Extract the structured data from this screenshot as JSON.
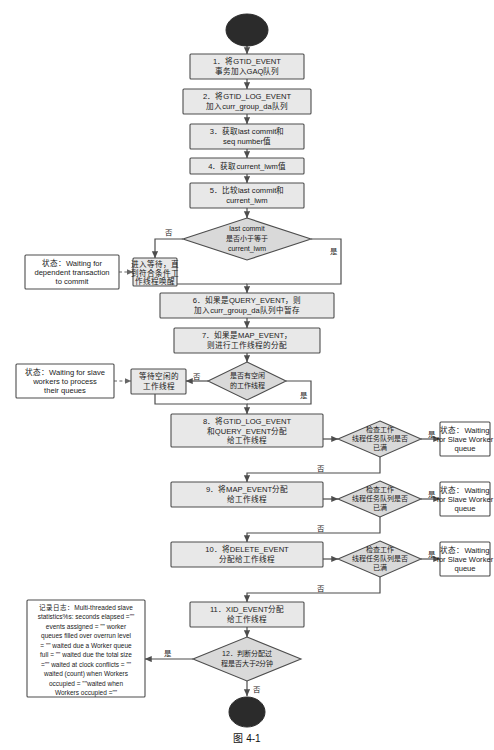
{
  "figure": {
    "caption": "图 4-1",
    "start_node": "",
    "end_node": ""
  },
  "steps": [
    {
      "id": "step1",
      "lines": [
        "1．将GTID_EVENT",
        "事务加入GAQ队列"
      ]
    },
    {
      "id": "step2",
      "lines": [
        "2．将GTID_LOG_EVENT",
        "加入curr_group_da队列"
      ]
    },
    {
      "id": "step3",
      "lines": [
        "3．获取last commit和",
        "seq number值"
      ]
    },
    {
      "id": "step4",
      "lines": [
        "4．获取current_lwm值"
      ]
    },
    {
      "id": "step5",
      "lines": [
        "5．比较last commit和",
        "current_lwm"
      ]
    },
    {
      "id": "wait_dep",
      "lines": [
        "进入等待，直",
        "到符合条件工",
        "作线程唤醒"
      ]
    },
    {
      "id": "step6",
      "lines": [
        "6．如果是QUERY_EVENT，则",
        "加入curr_group_da队列中暂存"
      ]
    },
    {
      "id": "step7",
      "lines": [
        "7．如果是MAP_EVENT，",
        "则进行工作线程的分配"
      ]
    },
    {
      "id": "wait_idle",
      "lines": [
        "等待空闲的",
        "工作线程"
      ]
    },
    {
      "id": "step8",
      "lines": [
        "8．将GTID_LOG_EVENT",
        "和QUERY_EVENT分配",
        "给工作线程"
      ]
    },
    {
      "id": "step9",
      "lines": [
        "9．将MAP_EVENT分配",
        "给工作线程"
      ]
    },
    {
      "id": "step10",
      "lines": [
        "10．将DELETE_EVENT",
        "分配给工作线程"
      ]
    },
    {
      "id": "step11",
      "lines": [
        "11．XID_EVENT分配",
        "给工作线程"
      ]
    }
  ],
  "decisions": [
    {
      "id": "dec_lastcommit",
      "lines": [
        "last commit",
        "是否小于等于",
        "current_lwm"
      ]
    },
    {
      "id": "dec_idle_worker",
      "lines": [
        "是否有空闲",
        "的工作线程"
      ]
    },
    {
      "id": "dec_queue_full_1",
      "lines": [
        "检查工作",
        "线程任务队列是否",
        "已满"
      ]
    },
    {
      "id": "dec_queue_full_2",
      "lines": [
        "检查工作",
        "线程任务队列是否",
        "已满"
      ]
    },
    {
      "id": "dec_queue_full_3",
      "lines": [
        "检查工作",
        "线程任务队列是否",
        "已满"
      ]
    },
    {
      "id": "dec_timeout",
      "lines": [
        "12．判断分配过",
        "程是否大于2分钟"
      ]
    }
  ],
  "states": [
    {
      "id": "state_dep_commit",
      "lines": [
        "状态：Waiting for",
        "dependent transaction",
        "to commit"
      ]
    },
    {
      "id": "state_slave_workers",
      "lines": [
        "状态：Waiting for slave",
        "workers to process",
        "their queues"
      ]
    },
    {
      "id": "state_worker_queue_1",
      "lines": [
        "状态：Waiting",
        "for Slave Worker",
        "queue"
      ]
    },
    {
      "id": "state_worker_queue_2",
      "lines": [
        "状态：Waiting",
        "for Slave Worker",
        "queue"
      ]
    },
    {
      "id": "state_worker_queue_3",
      "lines": [
        "状态：Waiting",
        "for Slave Worker",
        "queue"
      ]
    }
  ],
  "log_box": {
    "id": "log_note",
    "lines": [
      "记录日志：Multi-threaded slave",
      "statistics%s: seconds elapsed =\"\"",
      "events assigned = \"\" worker",
      "queues filled over overrun level",
      "= \"\" waited due a Worker queue",
      "full = \"\" waited due the total size",
      "=\"\" waited at clock conflicts = \"\"",
      "waited (count) when Workers",
      "occupied = \"\"waited when",
      "Workers occupied =\"\""
    ]
  },
  "edge_labels": {
    "no": "否",
    "yes": "是"
  },
  "colors": {
    "process_fill": "#e8e8e8",
    "decision_fill": "#d9d9d9",
    "state_fill": "#ffffff",
    "stroke": "#4d4d4d",
    "terminal_fill": "#2b2b2b",
    "text": "#1a1a1a"
  }
}
